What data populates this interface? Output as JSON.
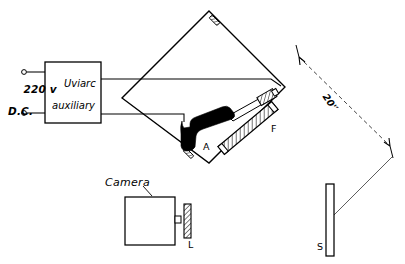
{
  "figure": {
    "background": "#ffffff",
    "ink": "#000000"
  },
  "labels": {
    "supply_line1": "220 v",
    "supply_line2": "D.C.",
    "box_line1": "Uviarc",
    "box_line2": "auxiliary",
    "arc": "A",
    "filter": "F",
    "lens": "L",
    "screen": "S",
    "camera": "Camera",
    "distance": "20'′"
  },
  "components": [
    {
      "id": "supply-terminals",
      "name": "220 v D.C. terminals",
      "count": 2
    },
    {
      "id": "uviarc-box",
      "name": "Uviarc auxiliary",
      "shape": "rectangle"
    },
    {
      "id": "enclosure",
      "name": "diamond enclosure",
      "shape": "rotated-square"
    },
    {
      "id": "arc-lamp",
      "name": "arc lamp A",
      "shape": "filled-bent-form"
    },
    {
      "id": "filter",
      "name": "filter F",
      "shape": "hatched-bar"
    },
    {
      "id": "camera",
      "name": "camera body",
      "shape": "rectangle"
    },
    {
      "id": "lens",
      "name": "lens L",
      "shape": "hatched-bar"
    },
    {
      "id": "screen",
      "name": "screen S",
      "shape": "tall-open-bar"
    },
    {
      "id": "dimension",
      "name": "distance dimension",
      "value": "20'′",
      "style": "dashed double arrow"
    }
  ]
}
